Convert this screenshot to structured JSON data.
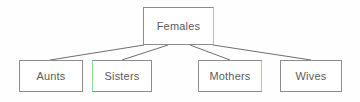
{
  "diagram": {
    "type": "tree",
    "canvas": {
      "width": 360,
      "height": 102,
      "background": "#fefefe"
    },
    "style": {
      "node_fill": "#ffffff",
      "node_stroke": "#8d8d8d",
      "edge_stroke": "#6e6e6e",
      "label_color": "#5b5b5b",
      "accent_green": "#8fdc8f",
      "accent_pink": "#d8b0ac"
    },
    "root": {
      "id": "females",
      "label": "Females",
      "x": 143,
      "y": 7,
      "width": 71,
      "height": 38
    },
    "children": [
      {
        "id": "aunts",
        "label": "Aunts",
        "x": 19,
        "y": 60,
        "width": 64,
        "height": 32
      },
      {
        "id": "sisters",
        "label": "Sisters",
        "x": 92,
        "y": 60,
        "width": 60,
        "height": 32
      },
      {
        "id": "mothers",
        "label": "Mothers",
        "x": 198,
        "y": 60,
        "width": 64,
        "height": 32
      },
      {
        "id": "wives",
        "label": "Wives",
        "x": 280,
        "y": 60,
        "width": 62,
        "height": 32
      }
    ],
    "edges": [
      {
        "id": "edge-females-aunts",
        "from": "females",
        "to": "aunts",
        "x1": 144,
        "y1": 45,
        "x2": 50,
        "y2": 60
      },
      {
        "id": "edge-females-sisters",
        "from": "females",
        "to": "sisters",
        "x1": 168,
        "y1": 45,
        "x2": 122,
        "y2": 60
      },
      {
        "id": "edge-females-mothers",
        "from": "females",
        "to": "mothers",
        "x1": 190,
        "y1": 45,
        "x2": 230,
        "y2": 60
      },
      {
        "id": "edge-females-wives",
        "from": "females",
        "to": "wives",
        "x1": 213,
        "y1": 45,
        "x2": 311,
        "y2": 60
      }
    ]
  }
}
